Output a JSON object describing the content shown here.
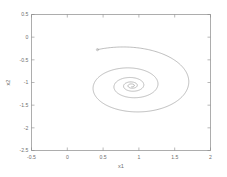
{
  "figure": {
    "background_color": "#ffffff",
    "line_color": "#9a9a9a",
    "axis_color": "#8a8a8a",
    "text_color": "#6e6e6e"
  },
  "chart_data": {
    "type": "line",
    "title": "",
    "subtitle": "",
    "xlabel": "x1",
    "ylabel": "x2",
    "xlim": [
      -0.5,
      2
    ],
    "ylim": [
      -2.5,
      0.5
    ],
    "xticks": [
      -0.5,
      0,
      0.5,
      1,
      1.5,
      2
    ],
    "xticklabels": [
      "-0.5",
      "0",
      "0.5",
      "1",
      "1.5",
      "2"
    ],
    "yticks": [
      -2.5,
      -2,
      -1.5,
      -1,
      -0.5,
      0,
      0.5
    ],
    "yticklabels": [
      "-2.5",
      "-2",
      "-1.5",
      "-1",
      "-0.5",
      "0",
      "0.5"
    ],
    "grid": false,
    "legend": null,
    "legend_position": "none",
    "annotations": [],
    "series": [
      {
        "name": "phase-trajectory",
        "description": "Damped spiral converging to a stable focus",
        "color": "#9a9a9a",
        "start_point": [
          0.0,
          0.1
        ],
        "equilibrium": [
          0.9,
          -1.07
        ],
        "decay_per_revolution": 0.46,
        "revolutions": 4.6,
        "radius_x_initial": 1.02,
        "radius_y_initial": 0.9,
        "initial_angle_deg": 118
      }
    ]
  }
}
